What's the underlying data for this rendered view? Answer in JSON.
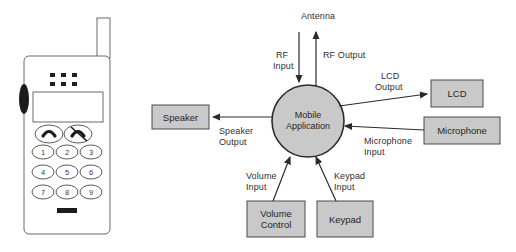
{
  "figure": {
    "background": "#ffffff",
    "box_fill": "#c9c9c9",
    "box_stroke": "#4a4a4a",
    "line_color": "#3a3a3a"
  },
  "process": {
    "label_line1": "Mobile",
    "label_line2": "Application"
  },
  "terminators": [
    {
      "id": "speaker",
      "label": "Speaker"
    },
    {
      "id": "lcd",
      "label": "LCD"
    },
    {
      "id": "microphone",
      "label": "Microphone"
    },
    {
      "id": "volume_control",
      "label_line1": "Volume",
      "label_line2": "Control"
    },
    {
      "id": "keypad",
      "label": "Keypad"
    }
  ],
  "flows": {
    "antenna": "Antenna",
    "rf_input_line1": "RF",
    "rf_input_line2": "Input",
    "rf_output": "RF Output",
    "lcd_output_line1": "LCD",
    "lcd_output_line2": "Output",
    "microphone_input_line1": "Microphone",
    "microphone_input_line2": "Input",
    "speaker_output_line1": "Speaker",
    "speaker_output_line2": "Output",
    "volume_input_line1": "Volume",
    "volume_input_line2": "Input",
    "keypad_input_line1": "Keypad",
    "keypad_input_line2": "Input"
  },
  "phone": {
    "keys": [
      "1",
      "2",
      "3",
      "4",
      "5",
      "6",
      "7",
      "8",
      "9"
    ]
  }
}
